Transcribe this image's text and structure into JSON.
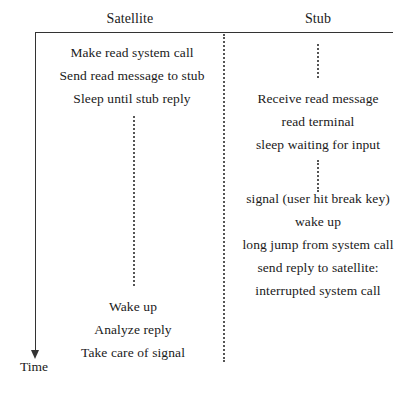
{
  "diagram": {
    "columns": {
      "satellite": {
        "header": "Satellite",
        "steps": [
          "Make read system call",
          "Send read message to stub",
          "Sleep until stub reply",
          "Wake up",
          "Analyze reply",
          "Take care of signal"
        ]
      },
      "stub": {
        "header": "Stub",
        "steps": [
          "Receive read message",
          "read terminal",
          "sleep waiting for input",
          "signal (user hit break key)",
          "wake up",
          "long jump from system call",
          "send reply to satellite:",
          "interrupted system call"
        ]
      }
    },
    "axis_label": "Time"
  }
}
